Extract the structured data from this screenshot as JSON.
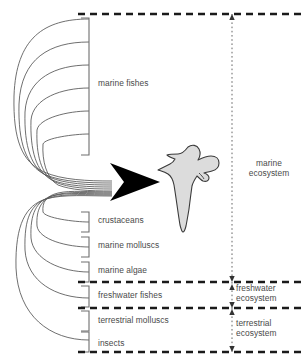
{
  "diagram": {
    "central_figure": {
      "name": "gull-silhouette",
      "fill_color": "#dcdcdc",
      "outline_color": "#3a3a3a"
    },
    "arrow": {
      "name": "convergence-arrow",
      "color": "#000000",
      "direction": "right"
    },
    "prey_groups": [
      {
        "label": "marine fishes",
        "bracket_lines": 6,
        "ecosystem": "marine"
      },
      {
        "label": "crustaceans",
        "bracket_lines": 1,
        "ecosystem": "marine"
      },
      {
        "label": "marine molluscs",
        "bracket_lines": 1,
        "ecosystem": "marine"
      },
      {
        "label": "marine algae",
        "bracket_lines": 1,
        "ecosystem": "marine"
      },
      {
        "label": "freshwater fishes",
        "bracket_lines": 1,
        "ecosystem": "freshwater"
      },
      {
        "label": "terrestrial molluscs",
        "bracket_lines": 1,
        "ecosystem": "terrestrial"
      },
      {
        "label": "insects",
        "bracket_lines": 1,
        "ecosystem": "terrestrial"
      }
    ],
    "ecosystems": [
      {
        "label_line1": "marine",
        "label_line2": "ecosystem"
      },
      {
        "label_line1": "freshwater",
        "label_line2": "ecosystem"
      },
      {
        "label_line1": "terrestrial",
        "label_line2": "ecosystem"
      }
    ],
    "ecosystem_labels_flat": [
      "marine ecosystem",
      "freshwater ecosystem",
      "terrestrial ecosystem"
    ],
    "style": {
      "divider_color": "#1a1a1a",
      "bracket_color": "#6e6e6e",
      "curve_color": "#555555",
      "text_color": "#4a4a4a",
      "background": "#ffffff"
    }
  }
}
